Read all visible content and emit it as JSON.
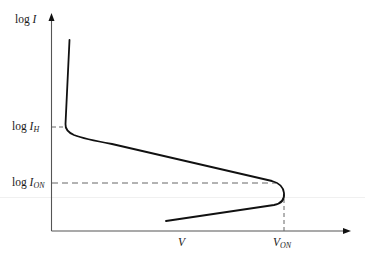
{
  "diagram": {
    "type": "current-voltage characteristic (log I vs V)",
    "y_axis": {
      "label_prefix": "log ",
      "label_var": "I"
    },
    "x_axis": {
      "label": "V"
    },
    "markers": {
      "holding_current": {
        "prefix": "log ",
        "var": "I",
        "sub": "H"
      },
      "on_current": {
        "prefix": "log ",
        "var": "I",
        "sub": "ON"
      },
      "on_voltage": {
        "var": "V",
        "sub": "ON"
      }
    },
    "colors": {
      "curve": "#111111",
      "axis": "#444444",
      "dashed": "#555555",
      "background": "#ffffff"
    }
  }
}
